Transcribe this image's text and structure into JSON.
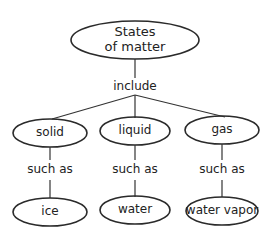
{
  "diagram": {
    "root": {
      "label_line1": "States",
      "label_line2": "of matter"
    },
    "root_link": "include",
    "categories": [
      {
        "label": "solid",
        "link": "such as",
        "example": "ice"
      },
      {
        "label": "liquid",
        "link": "such as",
        "example": "water"
      },
      {
        "label": "gas",
        "link": "such as",
        "example": "water vapor"
      }
    ],
    "colors": {
      "stroke": "#2a2a2a",
      "text": "#222222",
      "background": "#ffffff"
    }
  }
}
